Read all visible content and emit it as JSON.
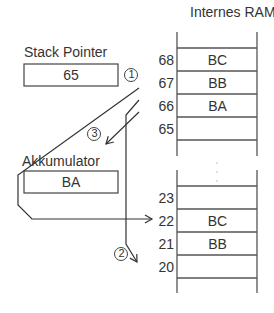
{
  "diagram": {
    "title": "Internes RAM",
    "ram_upper": {
      "rows": [
        {
          "address": "68",
          "value": "BC"
        },
        {
          "address": "67",
          "value": "BB"
        },
        {
          "address": "66",
          "value": "BA"
        },
        {
          "address": "65",
          "value": ""
        }
      ]
    },
    "ram_lower": {
      "rows": [
        {
          "address": "23",
          "value": ""
        },
        {
          "address": "22",
          "value": "BC"
        },
        {
          "address": "21",
          "value": "BB"
        },
        {
          "address": "20",
          "value": ""
        }
      ]
    },
    "stack_pointer": {
      "label": "Stack Pointer",
      "value": "65"
    },
    "accumulator": {
      "label": "Akkumulator",
      "value": "BA"
    },
    "steps": [
      {
        "id": "step-1",
        "label": "1"
      },
      {
        "id": "step-2",
        "label": "2"
      },
      {
        "id": "step-3",
        "label": "3"
      }
    ],
    "colors": {
      "line": "#333333",
      "background": "#ffffff"
    }
  }
}
